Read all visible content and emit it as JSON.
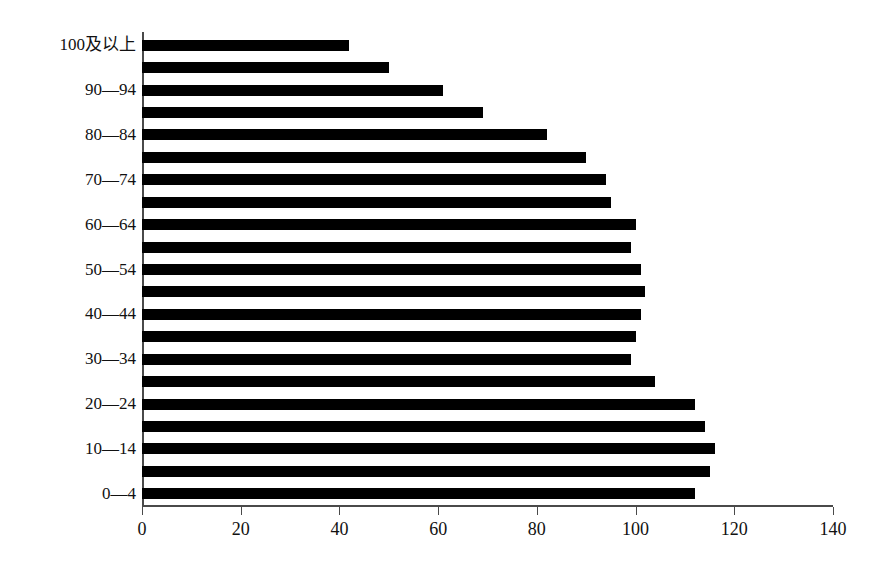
{
  "chart_data": {
    "type": "bar",
    "orientation": "horizontal",
    "title": "",
    "subtitle": "",
    "xlabel": "",
    "ylabel": "",
    "xlim": [
      0,
      140
    ],
    "ylim": null,
    "grid": false,
    "legend": null,
    "legend_position": "none",
    "bar_color": "#000000",
    "axis_color": "#4a4a4a",
    "xticks": [
      0,
      20,
      40,
      60,
      80,
      100,
      120,
      140
    ],
    "xtick_labels": [
      "0",
      "20",
      "40",
      "60",
      "80",
      "100",
      "120",
      "140"
    ],
    "ytick_labels": [
      "100及以上",
      "",
      "90—94",
      "",
      "80—84",
      "",
      "70—74",
      "",
      "60—64",
      "",
      "50—54",
      "",
      "40—44",
      "",
      "30—34",
      "",
      "20—24",
      "",
      "10—14",
      "",
      "0—4"
    ],
    "categories": [
      "100及以上",
      "95—99",
      "90—94",
      "85—89",
      "80—84",
      "75—79",
      "70—74",
      "65—69",
      "60—64",
      "55—59",
      "50—54",
      "45—49",
      "40—44",
      "35—39",
      "30—34",
      "25—29",
      "20—24",
      "15—19",
      "10—14",
      "5—9",
      "0—4"
    ],
    "values": [
      42,
      50,
      61,
      69,
      82,
      90,
      94,
      95,
      100,
      99,
      101,
      102,
      101,
      100,
      99,
      104,
      112,
      114,
      116,
      115,
      112
    ]
  }
}
